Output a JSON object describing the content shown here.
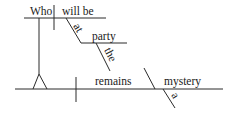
{
  "diagram": {
    "type": "sentence-diagram",
    "words": {
      "subject_clause_subject": "Who",
      "subject_clause_verb": "will be",
      "preposition": "at",
      "prep_object": "party",
      "prep_object_article": "the",
      "main_verb": "remains",
      "complement": "mystery",
      "complement_article": "a"
    },
    "colors": {
      "line": "#2a2a2a",
      "text": "#1a1a1a",
      "background": "#ffffff"
    }
  }
}
